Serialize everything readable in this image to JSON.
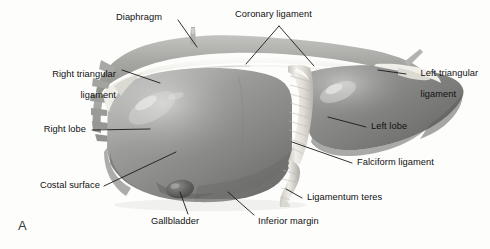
{
  "figure": {
    "panel_label": "A",
    "background_color": "#fdfdfc",
    "label_color": "#111111",
    "leader_color": "#1a1a1a"
  },
  "labels": {
    "diaphragm": "Diaphragm",
    "coronary_ligament": "Coronary ligament",
    "right_triangular_ligament_l1": "Right triangular",
    "right_triangular_ligament_l2": "ligament",
    "left_triangular_ligament_l1": "Left triangular",
    "left_triangular_ligament_l2": "ligament",
    "right_lobe": "Right lobe",
    "left_lobe": "Left lobe",
    "costal_surface": "Costal surface",
    "falciform_ligament": "Falciform ligament",
    "gallbladder": "Gallbladder",
    "ligamentum_teres": "Ligamentum teres",
    "inferior_margin": "Inferior margin"
  },
  "anatomy": {
    "tones": {
      "liver_mid": "#8c8c8c",
      "liver_dark": "#6f6f6f",
      "liver_light": "#bdbdbd",
      "ligament_white": "#efeeea",
      "diaphragm_gray": "#a9a9a6",
      "gallbladder_dark": "#5c5c5c"
    }
  }
}
